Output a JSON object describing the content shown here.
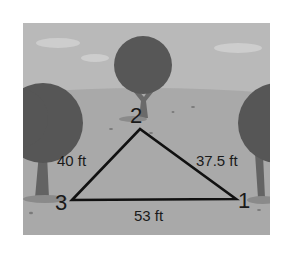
{
  "diagram": {
    "type": "triangle",
    "style": "grayscale park illustration",
    "colors": {
      "sky": "#b9b9b9",
      "cloud": "#cfcfcf",
      "ground": "#a8a8a8",
      "tree_foliage": "#555555",
      "tree_trunk": "#666666",
      "triangle_stroke": "#111111",
      "text": "#1a1a1a"
    },
    "vertices": [
      {
        "id": "1",
        "label": "1"
      },
      {
        "id": "2",
        "label": "2"
      },
      {
        "id": "3",
        "label": "3"
      }
    ],
    "sides": [
      {
        "between": [
          "3",
          "2"
        ],
        "label": "40 ft"
      },
      {
        "between": [
          "2",
          "1"
        ],
        "label": "37.5 ft"
      },
      {
        "between": [
          "3",
          "1"
        ],
        "label": "53 ft"
      }
    ]
  }
}
